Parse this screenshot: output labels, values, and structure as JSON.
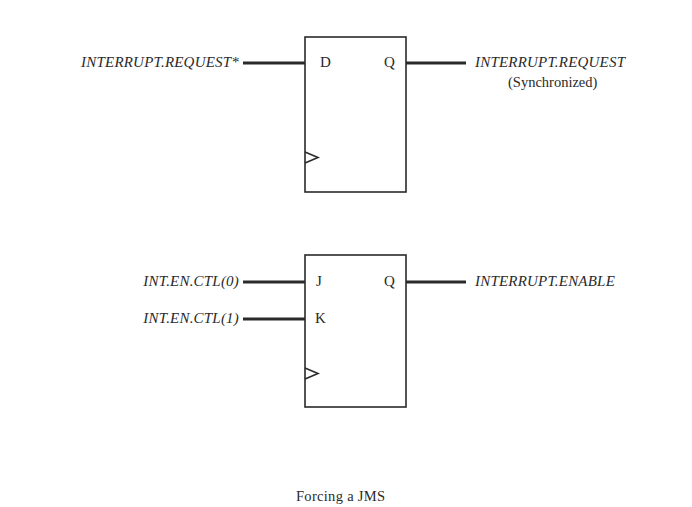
{
  "diagram": {
    "flipflop_d": {
      "type": "D flip-flop",
      "pins": {
        "d": "D",
        "q": "Q"
      },
      "input_signal": "INTERRUPT.REQUEST*",
      "output_signal": "INTERRUPT.REQUEST",
      "output_note": "(Synchronized)"
    },
    "flipflop_jk": {
      "type": "JK flip-flop",
      "pins": {
        "j": "J",
        "k": "K",
        "q": "Q"
      },
      "input_j_signal": "INT.EN.CTL(0)",
      "input_k_signal": "INT.EN.CTL(1)",
      "output_signal": "INTERRUPT.ENABLE"
    },
    "caption": "Forcing a JMS",
    "colors": {
      "ink": "#2a2a2a",
      "background": "#ffffff"
    }
  }
}
